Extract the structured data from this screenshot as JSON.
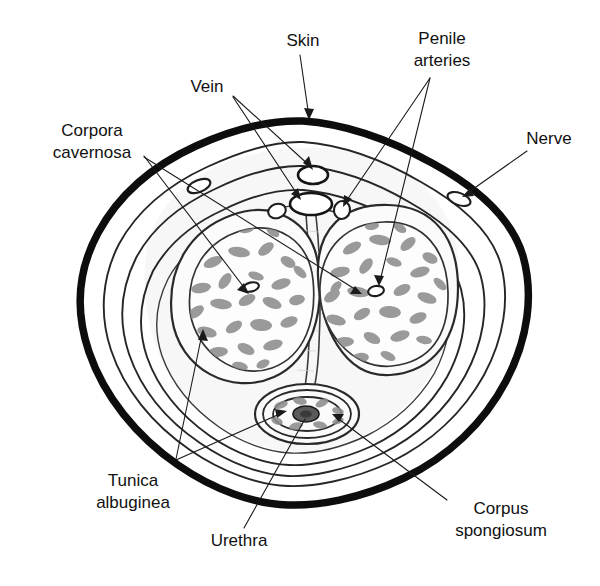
{
  "figure": {
    "type": "anatomical-cross-section",
    "background_color": "#ffffff",
    "ink_color": "#111111",
    "width": 600,
    "height": 586
  },
  "labels": [
    {
      "id": "skin",
      "text": "Skin",
      "x": 303,
      "y": 42,
      "anchor": "middle",
      "lines": 1
    },
    {
      "id": "penile-arteries",
      "text_lines": [
        "Penile",
        "arteries"
      ],
      "x": 442,
      "y": 40,
      "anchor": "middle",
      "lines": 2
    },
    {
      "id": "vein",
      "text": "Vein",
      "x": 207,
      "y": 88,
      "anchor": "middle",
      "lines": 1
    },
    {
      "id": "nerve",
      "text": "Nerve",
      "x": 549,
      "y": 140,
      "anchor": "middle",
      "lines": 1
    },
    {
      "id": "corpora-cavernosa",
      "text_lines": [
        "Corpora",
        "cavernosa"
      ],
      "x": 92,
      "y": 139,
      "anchor": "middle",
      "lines": 2
    },
    {
      "id": "tunica-albuginea",
      "text_lines": [
        "Tunica",
        "albuginea"
      ],
      "x": 133,
      "y": 489,
      "anchor": "middle",
      "lines": 2
    },
    {
      "id": "urethra",
      "text": "Urethra",
      "x": 239,
      "y": 542,
      "anchor": "middle",
      "lines": 1
    },
    {
      "id": "corpus-spongiosum",
      "text_lines": [
        "Corpus",
        "spongiosum"
      ],
      "x": 501,
      "y": 517,
      "anchor": "middle",
      "lines": 2
    }
  ],
  "structures": [
    {
      "id": "skin-outline",
      "name": "Skin (outer dark border)"
    },
    {
      "id": "dartos-layer",
      "name": "Subcutaneous layer"
    },
    {
      "id": "bucks-fascia",
      "name": "Deep fascia layer"
    },
    {
      "id": "tunica-albuginea-layer",
      "name": "Tunica albuginea"
    },
    {
      "id": "corpus-cavernosum-left",
      "name": "Left corpus cavernosum"
    },
    {
      "id": "corpus-cavernosum-right",
      "name": "Right corpus cavernosum"
    },
    {
      "id": "corpus-spongiosum-body",
      "name": "Corpus spongiosum"
    },
    {
      "id": "urethra-lumen",
      "name": "Urethra"
    },
    {
      "id": "deep-dorsal-vein",
      "name": "Deep dorsal vein"
    },
    {
      "id": "superficial-dorsal-vein",
      "name": "Superficial dorsal vein"
    },
    {
      "id": "dorsal-artery-left",
      "name": "Left dorsal penile artery"
    },
    {
      "id": "dorsal-artery-right",
      "name": "Right dorsal penile artery"
    },
    {
      "id": "cavernosal-artery-left",
      "name": "Left cavernosal artery"
    },
    {
      "id": "cavernosal-artery-right",
      "name": "Right cavernosal artery"
    },
    {
      "id": "dorsal-nerve-left",
      "name": "Left dorsal nerve"
    },
    {
      "id": "dorsal-nerve-right",
      "name": "Right dorsal nerve"
    }
  ]
}
